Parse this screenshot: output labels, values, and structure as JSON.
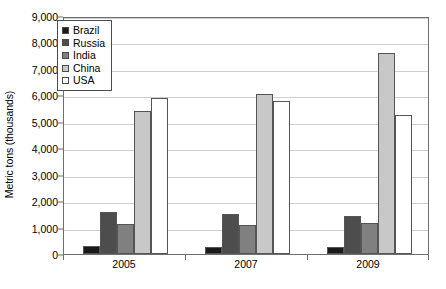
{
  "chart_data": {
    "type": "bar",
    "title": "",
    "subtitle": "",
    "xlabel": "",
    "ylabel": "Metric tons (thousands)",
    "categories": [
      "2005",
      "2007",
      "2009"
    ],
    "series": [
      {
        "name": "Brazil",
        "color": "#1a1a1a",
        "values": [
          300,
          280,
          250
        ]
      },
      {
        "name": "Russia",
        "color": "#4d4d4d",
        "values": [
          1600,
          1530,
          1450
        ]
      },
      {
        "name": "India",
        "color": "#808080",
        "values": [
          1150,
          1100,
          1180
        ]
      },
      {
        "name": "China",
        "color": "#c8c8c8",
        "values": [
          5400,
          6050,
          7600
        ]
      },
      {
        "name": "USA",
        "color": "#ffffff",
        "values": [
          5900,
          5800,
          5250
        ]
      }
    ],
    "ylim": [
      0,
      9000
    ],
    "yticks": [
      0,
      1000,
      2000,
      3000,
      4000,
      5000,
      6000,
      7000,
      8000,
      9000
    ],
    "ytick_labels": [
      "0",
      "1,000",
      "2,000",
      "3,000",
      "4,000",
      "5,000",
      "6,000",
      "7,000",
      "8,000",
      "9,000"
    ],
    "grid": true,
    "grid_axis": "y",
    "legend_position": "top-left",
    "legend_entries": [
      "Brazil",
      "Russia",
      "India",
      "China",
      "USA"
    ],
    "bar_border_color": "#555555",
    "frame_color": "#6e6e6e",
    "gridline_color": "#cfcfcf",
    "background": "#ffffff"
  }
}
